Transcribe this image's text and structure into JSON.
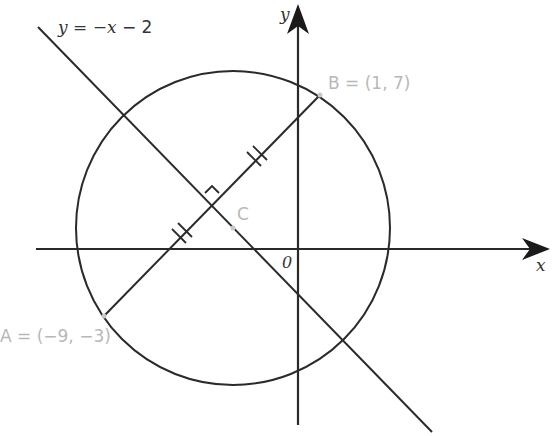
{
  "diagram": {
    "type": "coordinate-geometry",
    "axes": {
      "x_label": "x",
      "y_label": "y",
      "origin_label": "0"
    },
    "line": {
      "equation_label": "y = −x − 2",
      "equation_prefix": "y = −x − ",
      "equation_constant": "2"
    },
    "points": {
      "A": {
        "label": "A = (−9, −3)"
      },
      "B": {
        "label": "B = (1, 7)"
      },
      "C": {
        "label": "C"
      }
    },
    "circle": {
      "description": "circle with diameter AB, centre C"
    },
    "markings": [
      "right-angle at intersection of AB and line",
      "double tick marks showing equal segments"
    ],
    "colors": {
      "stroke": "#2a2a2a",
      "point_label": "#b8b8b8"
    }
  }
}
